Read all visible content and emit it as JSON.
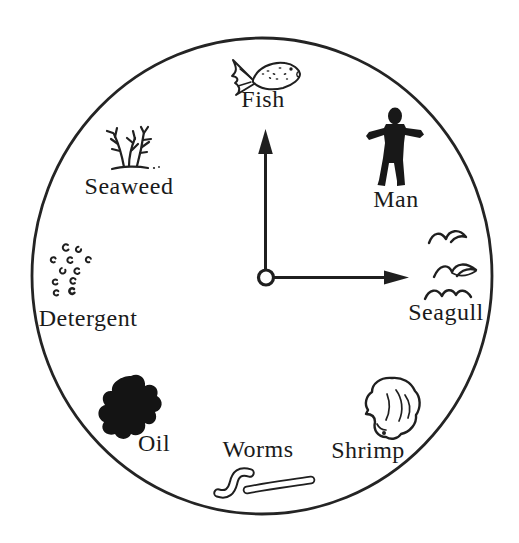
{
  "diagram": {
    "type": "circular-ecosystem-clock",
    "background": "#ffffff",
    "ink": "#1f1f1f",
    "center_arrows": [
      "up",
      "right"
    ],
    "items": [
      {
        "name": "fish",
        "label": "Fish",
        "position": "12-oclock"
      },
      {
        "name": "man",
        "label": "Man",
        "position": "1-oclock"
      },
      {
        "name": "seagull",
        "label": "Seagull",
        "position": "3-oclock"
      },
      {
        "name": "shrimp",
        "label": "Shrimp",
        "position": "5-oclock"
      },
      {
        "name": "worms",
        "label": "Worms",
        "position": "6-oclock"
      },
      {
        "name": "oil",
        "label": "Oil",
        "position": "7-oclock"
      },
      {
        "name": "detergent",
        "label": "Detergent",
        "position": "9-oclock"
      },
      {
        "name": "seaweed",
        "label": "Seaweed",
        "position": "10-oclock"
      }
    ]
  }
}
